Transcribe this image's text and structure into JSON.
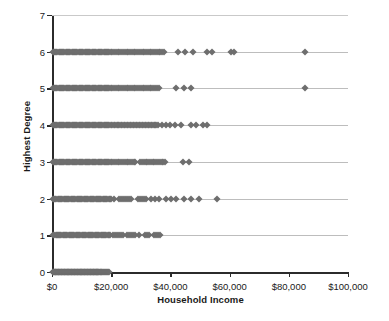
{
  "chart_data": {
    "type": "scatter",
    "title": "",
    "xlabel": "Household Income",
    "ylabel": "Highest Degree",
    "xlim": [
      0,
      100000
    ],
    "ylim": [
      0,
      7
    ],
    "grid": true,
    "legend": null,
    "marker": {
      "shape": "diamond",
      "color": "#6e6e6e",
      "size": 5
    },
    "xticks": [
      0,
      20000,
      40000,
      60000,
      80000,
      100000
    ],
    "xtick_labels": [
      "$0",
      "$20,000",
      "$40,000",
      "$60,000",
      "$80,000",
      "$100,000"
    ],
    "yticks": [
      0,
      1,
      2,
      3,
      4,
      5,
      6,
      7
    ],
    "ytick_labels": [
      "0",
      "1",
      "2",
      "3",
      "4",
      "5",
      "6",
      "7"
    ],
    "series": [
      {
        "name": "Highest Degree 0",
        "y": 0,
        "x": [
          300,
          500,
          700,
          900,
          1100,
          1300,
          1500,
          1700,
          1900,
          2100,
          2300,
          2500,
          2700,
          2900,
          3100,
          3300,
          3500,
          3700,
          3900,
          4100,
          4300,
          4500,
          4700,
          4900,
          5100,
          5300,
          5500,
          5700,
          5900,
          6100,
          6300,
          6500,
          6700,
          6900,
          7100,
          7300,
          7500,
          7700,
          7900,
          8100,
          8300,
          8500,
          8700,
          8900,
          9100,
          9300,
          9500,
          9700,
          9900,
          10100,
          10300,
          10500,
          10700,
          10900,
          11100,
          11300,
          11500,
          11700,
          11900,
          12100,
          12300,
          12500,
          12700,
          12900,
          13100,
          13300,
          13500,
          13700,
          13900,
          14100,
          14300,
          14500,
          14700,
          14900,
          15100,
          15300,
          15500,
          15700,
          15900,
          16100,
          16400,
          16700,
          17000,
          17300,
          17600,
          17900,
          18200,
          18500,
          18800,
          19100
        ]
      },
      {
        "name": "Highest Degree 1",
        "y": 1,
        "x": [
          400,
          800,
          1200,
          1600,
          2000,
          2400,
          2800,
          3200,
          3600,
          4000,
          4400,
          4800,
          5200,
          5600,
          6000,
          6400,
          6800,
          7200,
          7600,
          8000,
          8400,
          8800,
          9200,
          9600,
          10000,
          10400,
          10800,
          11200,
          11600,
          12000,
          12400,
          12800,
          13200,
          13600,
          14000,
          14400,
          14800,
          15200,
          15600,
          16000,
          16400,
          16800,
          17200,
          17600,
          18000,
          18400,
          18800,
          19200,
          19600,
          20500,
          21200,
          21900,
          22600,
          23300,
          24000,
          25200,
          25900,
          26600,
          27300,
          28000,
          29500,
          31500,
          32200,
          32900,
          34500,
          35200,
          35900,
          36600
        ]
      },
      {
        "name": "Highest Degree 2",
        "y": 2,
        "x": [
          300,
          700,
          1100,
          1500,
          1900,
          2300,
          2700,
          3100,
          3500,
          3900,
          4300,
          4700,
          5100,
          5500,
          5900,
          6300,
          6700,
          7100,
          7500,
          7900,
          8300,
          8700,
          9100,
          9500,
          9900,
          10300,
          10700,
          11100,
          11500,
          11900,
          12300,
          12700,
          13100,
          13500,
          13900,
          14300,
          14700,
          15100,
          15500,
          15900,
          16300,
          16700,
          17100,
          17500,
          17900,
          18300,
          18700,
          19100,
          19500,
          19900,
          21000,
          22500,
          23200,
          23900,
          24600,
          25300,
          26000,
          26700,
          29000,
          29700,
          30400,
          31100,
          31800,
          33500,
          34800,
          36200,
          38500,
          40200,
          41800,
          44500,
          47000,
          49500,
          55800
        ]
      },
      {
        "name": "Highest Degree 3",
        "y": 3,
        "x": [
          200,
          600,
          1000,
          1400,
          1800,
          2200,
          2600,
          3000,
          3400,
          3800,
          4200,
          4600,
          5000,
          5400,
          5800,
          6200,
          6600,
          7000,
          7400,
          7800,
          8200,
          8600,
          9000,
          9400,
          9800,
          10200,
          10600,
          11000,
          11400,
          11800,
          12200,
          12600,
          13000,
          13400,
          13800,
          14200,
          14600,
          15000,
          15400,
          15800,
          16200,
          16600,
          17000,
          17400,
          17800,
          18200,
          18600,
          19000,
          19400,
          19800,
          20400,
          21000,
          21600,
          22200,
          22800,
          23400,
          24000,
          24600,
          25200,
          25800,
          26400,
          27000,
          27600,
          28200,
          29800,
          30400,
          31000,
          31600,
          32200,
          32800,
          33400,
          34000,
          34600,
          35200,
          35800,
          36400,
          37000,
          37600,
          38200,
          44200,
          46200
        ]
      },
      {
        "name": "Highest Degree 4",
        "y": 4,
        "x": [
          200,
          600,
          1000,
          1400,
          1800,
          2200,
          2600,
          3000,
          3400,
          3800,
          4200,
          4600,
          5000,
          5400,
          5800,
          6200,
          6600,
          7000,
          7400,
          7800,
          8200,
          8600,
          9000,
          9400,
          9800,
          10200,
          10600,
          11000,
          11400,
          11800,
          12200,
          12600,
          13000,
          13400,
          13800,
          14200,
          14600,
          15000,
          15400,
          15800,
          16200,
          16600,
          17000,
          17400,
          17800,
          18200,
          18600,
          19000,
          19400,
          19800,
          20300,
          20800,
          21300,
          21800,
          22300,
          22800,
          23300,
          23800,
          24300,
          24800,
          25300,
          25800,
          26300,
          26800,
          27300,
          27800,
          28300,
          28800,
          29300,
          29800,
          30300,
          30800,
          31300,
          31800,
          32300,
          32800,
          33300,
          33800,
          34300,
          34800,
          35300,
          35800,
          37000,
          38500,
          40000,
          41500,
          43500,
          47000,
          48500,
          51000,
          52500
        ]
      },
      {
        "name": "Highest Degree 5",
        "y": 5,
        "x": [
          200,
          600,
          1000,
          1400,
          1800,
          2200,
          2600,
          3000,
          3400,
          3800,
          4200,
          4600,
          5000,
          5400,
          5800,
          6200,
          6600,
          7000,
          7400,
          7800,
          8200,
          8600,
          9000,
          9400,
          9800,
          10200,
          10600,
          11000,
          11400,
          11800,
          12200,
          12600,
          13000,
          13400,
          13800,
          14200,
          14600,
          15000,
          15400,
          15800,
          16200,
          16600,
          17000,
          17400,
          17800,
          18200,
          18600,
          19000,
          19400,
          19800,
          20400,
          21000,
          21600,
          22200,
          22800,
          23400,
          24000,
          24600,
          25200,
          25800,
          26400,
          27000,
          27600,
          28200,
          28800,
          29400,
          30000,
          30600,
          31200,
          31800,
          32400,
          33000,
          33600,
          34200,
          34800,
          35400,
          36000,
          42000,
          44500,
          47000,
          85500
        ]
      },
      {
        "name": "Highest Degree 6",
        "y": 6,
        "x": [
          200,
          600,
          1000,
          1400,
          1800,
          2200,
          2600,
          3000,
          3400,
          3800,
          4200,
          4600,
          5000,
          5400,
          5800,
          6200,
          6600,
          7000,
          7400,
          7800,
          8200,
          8600,
          9000,
          9400,
          9800,
          10200,
          10600,
          11000,
          11400,
          11800,
          12200,
          12600,
          13000,
          13400,
          13800,
          14200,
          14600,
          15000,
          15400,
          15800,
          16200,
          16600,
          17000,
          17400,
          17800,
          18200,
          18600,
          19000,
          19400,
          19800,
          20400,
          21000,
          21600,
          22200,
          22800,
          23400,
          24000,
          24600,
          25200,
          25800,
          26400,
          27000,
          27600,
          28200,
          28800,
          29400,
          30000,
          30600,
          31200,
          31800,
          32400,
          33000,
          33600,
          34200,
          34800,
          35400,
          36000,
          36600,
          37200,
          37800,
          42500,
          45000,
          47500,
          52500,
          54000,
          60500,
          61500,
          85500
        ]
      }
    ]
  }
}
